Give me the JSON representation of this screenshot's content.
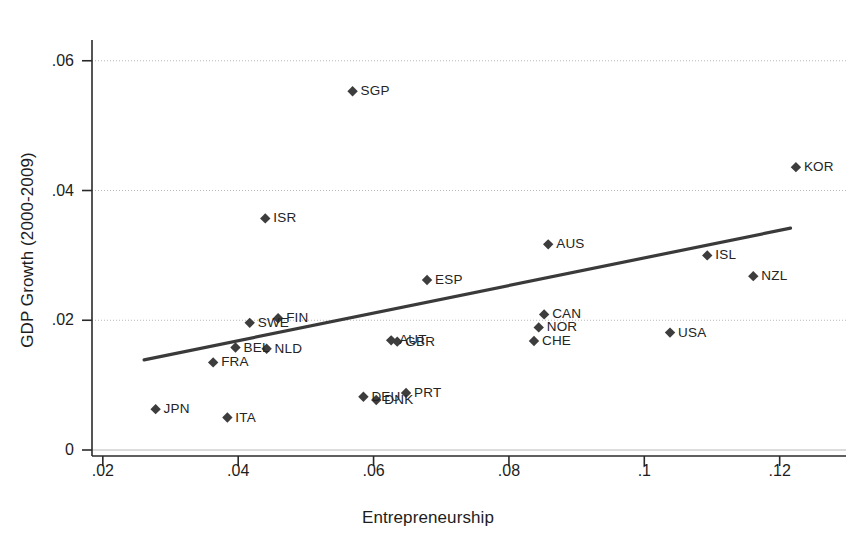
{
  "chart_data": {
    "type": "scatter",
    "title": "",
    "xlabel": "Entrepreneurship",
    "ylabel": "GDP Growth (2000-2009)",
    "xlim": [
      0.0184,
      0.1298
    ],
    "ylim": [
      0.0,
      0.0632
    ],
    "xticks": [
      ".02",
      ".04",
      ".06",
      ".08",
      ".1",
      ".12"
    ],
    "xtick_values": [
      0.02,
      0.04,
      0.06,
      0.08,
      0.1,
      0.12
    ],
    "yticks": [
      ".06",
      ".04",
      ".02",
      "0"
    ],
    "ytick_values": [
      0.06,
      0.04,
      0.02,
      0
    ],
    "grid": "horizontal",
    "legend": "none",
    "marker": "diamond",
    "marker_color": "#3d3d3d",
    "line_color": "#3a3a3a",
    "grid_color": "#b8b8b8",
    "points": [
      {
        "label": "SGP",
        "x": 0.0569,
        "y": 0.0553
      },
      {
        "label": "KOR",
        "x": 0.1224,
        "y": 0.0436
      },
      {
        "label": "ISR",
        "x": 0.044,
        "y": 0.0357
      },
      {
        "label": "AUS",
        "x": 0.0858,
        "y": 0.0317
      },
      {
        "label": "ISL",
        "x": 0.1093,
        "y": 0.03
      },
      {
        "label": "NZL",
        "x": 0.1161,
        "y": 0.0268
      },
      {
        "label": "ESP",
        "x": 0.0679,
        "y": 0.0262
      },
      {
        "label": "CAN",
        "x": 0.0852,
        "y": 0.0209
      },
      {
        "label": "FIN",
        "x": 0.0459,
        "y": 0.0203
      },
      {
        "label": "SWE",
        "x": 0.0417,
        "y": 0.0196
      },
      {
        "label": "NOR",
        "x": 0.0844,
        "y": 0.0189
      },
      {
        "label": "USA",
        "x": 0.1038,
        "y": 0.0181
      },
      {
        "label": "AUT",
        "x": 0.0626,
        "y": 0.0169
      },
      {
        "label": "GBR",
        "x": 0.0635,
        "y": 0.0167
      },
      {
        "label": "CHE",
        "x": 0.0837,
        "y": 0.0168
      },
      {
        "label": "BEL",
        "x": 0.0396,
        "y": 0.0158
      },
      {
        "label": "NLD",
        "x": 0.0442,
        "y": 0.0156
      },
      {
        "label": "FRA",
        "x": 0.0363,
        "y": 0.0135
      },
      {
        "label": "PRT",
        "x": 0.0648,
        "y": 0.0088
      },
      {
        "label": "DEU",
        "x": 0.0585,
        "y": 0.0082
      },
      {
        "label": "DNK",
        "x": 0.0604,
        "y": 0.0077
      },
      {
        "label": "JPN",
        "x": 0.0278,
        "y": 0.0063
      },
      {
        "label": "ITA",
        "x": 0.0384,
        "y": 0.005
      }
    ],
    "fit_line": {
      "name": "linear fit",
      "x_start": 0.0261,
      "y_start": 0.0139,
      "x_end": 0.1216,
      "y_end": 0.0342
    }
  }
}
